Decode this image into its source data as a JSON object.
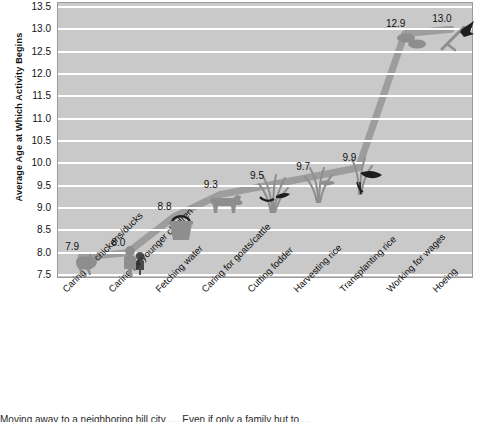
{
  "chart_data": {
    "type": "line",
    "title": "",
    "xlabel": "",
    "ylabel": "Average Age at Which Activity Begins",
    "ylim": [
      7.5,
      13.5
    ],
    "ytick_step": 0.5,
    "grid": true,
    "legend": "none",
    "categories": [
      "Caring for chickens/ducks",
      "Caring for younger children",
      "Fetching water",
      "Caring for goats/cattle",
      "Cutting fodder",
      "Harvesting  rice",
      "Transplanting rice",
      "Working for wages",
      "Hoeing"
    ],
    "values": [
      7.9,
      8.0,
      8.8,
      9.3,
      9.5,
      9.7,
      9.9,
      12.9,
      13.0
    ],
    "value_labels": [
      "7.9",
      "8.0",
      "8.8",
      "9.3",
      "9.5",
      "9.7",
      "9.9",
      "12.9",
      "13.0"
    ],
    "ytick_labels": [
      "13.5",
      "13.0",
      "12.5",
      "12.0",
      "11.5",
      "11.0",
      "10.5",
      "10.0",
      "9.5",
      "9.0",
      "8.5",
      "8.0",
      "7.5"
    ],
    "point_icons": [
      "chicken-icon",
      "children-icon",
      "water-bucket-icon",
      "cattle-icon",
      "fodder-grass-icon",
      "rice-harvest-icon",
      "rice-transplant-icon",
      "wages-coins-icon",
      "hoe-icon"
    ],
    "colors": {
      "plot_background": "#c9c9c9",
      "gridline": "#ffffff",
      "series_line": "#9d9d9d",
      "text": "#111111",
      "pictogram": "#8e8e8e",
      "pictogram_dark": "#1d1d1d"
    }
  },
  "caption": {
    "line": "Moving away to a neighboring hill city ....   Even if only a family hut to ..."
  }
}
